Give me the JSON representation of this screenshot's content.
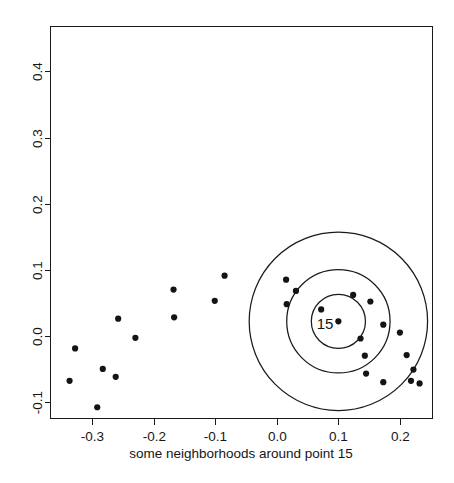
{
  "chart_data": {
    "type": "scatter",
    "title": "",
    "xlabel": "some neighborhoods around point 15",
    "ylabel": "",
    "xlim": [
      -0.368,
      0.253
    ],
    "ylim": [
      -0.125,
      0.468
    ],
    "xticks": [
      -0.3,
      -0.2,
      -0.1,
      0.0,
      0.1,
      0.2
    ],
    "xticklabels": [
      "-0.3",
      "-0.2",
      "-0.1",
      "0.0",
      "0.1",
      "0.2"
    ],
    "yticks": [
      -0.1,
      0.0,
      0.1,
      0.2,
      0.3,
      0.4
    ],
    "yticklabels": [
      "-0.1",
      "0.0",
      "0.1",
      "0.2",
      "0.3",
      "0.4"
    ],
    "grid": false,
    "legend": null,
    "y_tick_label_rotation": -90,
    "point_color": "#141414",
    "point_size": 3.1,
    "line_color": "#1a1a1a",
    "background": "#ffffff",
    "annotations": [
      {
        "text": "15",
        "x": 0.092,
        "y": 0.018,
        "name": "center-point-label"
      }
    ],
    "circles": [
      {
        "name": "inner-neighborhood",
        "cx": 0.1,
        "cy": 0.022,
        "r": 0.044
      },
      {
        "name": "middle-neighborhood",
        "cx": 0.1,
        "cy": 0.022,
        "r": 0.084
      },
      {
        "name": "outer-neighborhood",
        "cx": 0.1,
        "cy": 0.022,
        "r": 0.145
      }
    ],
    "points": [
      {
        "x": -0.337,
        "y": -0.068
      },
      {
        "x": -0.328,
        "y": -0.019
      },
      {
        "x": -0.292,
        "y": -0.108
      },
      {
        "x": -0.283,
        "y": -0.05
      },
      {
        "x": -0.262,
        "y": -0.062
      },
      {
        "x": -0.258,
        "y": 0.026
      },
      {
        "x": -0.23,
        "y": -0.003
      },
      {
        "x": -0.168,
        "y": 0.07
      },
      {
        "x": -0.167,
        "y": 0.028
      },
      {
        "x": -0.101,
        "y": 0.053
      },
      {
        "x": -0.085,
        "y": 0.091
      },
      {
        "x": 0.015,
        "y": 0.085
      },
      {
        "x": 0.031,
        "y": 0.068
      },
      {
        "x": 0.016,
        "y": 0.048
      },
      {
        "x": 0.072,
        "y": 0.04
      },
      {
        "x": 0.1,
        "y": 0.022
      },
      {
        "x": 0.124,
        "y": 0.062
      },
      {
        "x": 0.152,
        "y": 0.052
      },
      {
        "x": 0.136,
        "y": -0.004
      },
      {
        "x": 0.173,
        "y": 0.017
      },
      {
        "x": 0.2,
        "y": 0.005
      },
      {
        "x": 0.143,
        "y": -0.03
      },
      {
        "x": 0.211,
        "y": -0.029
      },
      {
        "x": 0.145,
        "y": -0.057
      },
      {
        "x": 0.222,
        "y": -0.051
      },
      {
        "x": 0.173,
        "y": -0.07
      },
      {
        "x": 0.218,
        "y": -0.068
      },
      {
        "x": 0.232,
        "y": -0.072
      }
    ]
  }
}
